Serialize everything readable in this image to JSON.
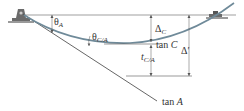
{
  "diagram": {
    "colors": {
      "beam_curve": "#6f8a99",
      "lines": "#555555",
      "support": "#6b6b6b",
      "ground": "#9a9a9a"
    },
    "labels": {
      "theta_a": {
        "symbol": "θ",
        "sub": "A"
      },
      "theta_ca": {
        "symbol": "θ",
        "sub": "C/A"
      },
      "delta_c": {
        "symbol": "Δ",
        "sub": "C"
      },
      "tan_c": {
        "text": "tan ",
        "var": "C"
      },
      "t_ca": {
        "symbol": "t",
        "sub": "C/A"
      },
      "delta_prime": {
        "symbol": "Δ′"
      },
      "tan_a": {
        "text": "tan ",
        "var": "A"
      }
    },
    "supports": [
      {
        "type": "pin",
        "position": "left"
      },
      {
        "type": "roller",
        "position": "right"
      }
    ]
  }
}
